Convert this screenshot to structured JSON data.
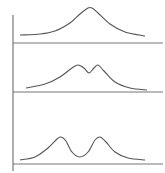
{
  "figure": {
    "width": 165,
    "height": 173,
    "stroke_color": "#555555",
    "axis_color": "#777777",
    "background": "#ffffff",
    "vertical_axis": {
      "x": 13,
      "y_top": 15,
      "y_bottom": 171
    }
  },
  "chart_data": {
    "type": "line",
    "title": "",
    "xlabel": "",
    "ylabel": "",
    "grid": false,
    "panels": [
      {
        "name": "single-peak",
        "baseline_y": 43,
        "curve": [
          [
            20,
            35
          ],
          [
            40,
            34
          ],
          [
            55,
            31
          ],
          [
            70,
            23
          ],
          [
            80,
            14
          ],
          [
            88,
            8
          ],
          [
            92,
            8
          ],
          [
            98,
            13
          ],
          [
            110,
            24
          ],
          [
            125,
            32
          ],
          [
            145,
            36
          ]
        ]
      },
      {
        "name": "partially-resolved-doublet",
        "baseline_y": 92,
        "curve": [
          [
            26,
            88
          ],
          [
            45,
            84
          ],
          [
            60,
            77
          ],
          [
            72,
            68
          ],
          [
            78,
            65
          ],
          [
            84,
            68
          ],
          [
            89,
            73
          ],
          [
            94,
            68
          ],
          [
            98,
            65
          ],
          [
            104,
            71
          ],
          [
            115,
            82
          ],
          [
            130,
            88
          ],
          [
            147,
            90
          ]
        ]
      },
      {
        "name": "resolved-doublet",
        "baseline_y": 164,
        "curve": [
          [
            20,
            160
          ],
          [
            35,
            157
          ],
          [
            48,
            148
          ],
          [
            57,
            139
          ],
          [
            61,
            137
          ],
          [
            66,
            141
          ],
          [
            72,
            152
          ],
          [
            80,
            157
          ],
          [
            88,
            152
          ],
          [
            95,
            140
          ],
          [
            100,
            137
          ],
          [
            106,
            142
          ],
          [
            115,
            152
          ],
          [
            128,
            158
          ],
          [
            145,
            160
          ]
        ]
      }
    ]
  }
}
